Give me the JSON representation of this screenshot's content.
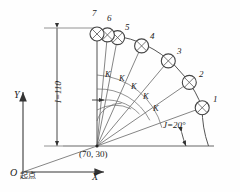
{
  "diagram": {
    "center_coordinate_label": "(70, 30)",
    "radius_dim_label": "I=110",
    "start_angle_label": "J=20°",
    "increment_label": "K",
    "origin_label": "O",
    "origin_note": "起点",
    "axis_x_label": "X",
    "axis_y_label": "Y",
    "hole_labels": [
      "1",
      "2",
      "3",
      "4",
      "5",
      "6",
      "7"
    ],
    "increment_labels": [
      "K",
      "K",
      "K",
      "K",
      "K"
    ],
    "colors": {
      "line": "#555555",
      "axis": "#8a8a8a",
      "text": "#1a1a1a",
      "circle": "#444444",
      "background": "#fefefe"
    },
    "geometry": {
      "center_x": 97,
      "center_y": 146,
      "radius": 112,
      "start_angle_deg": 20,
      "increment_deg": 23.3,
      "hole_count": 7,
      "hole_radius": 7
    }
  }
}
